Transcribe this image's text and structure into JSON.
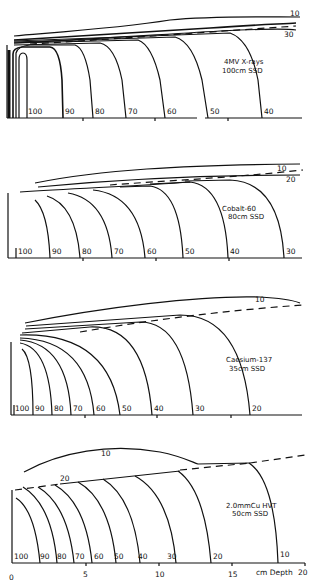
{
  "figure": {
    "type": "isodose charts",
    "x_axis": {
      "label": "cm Depth",
      "ticks": [
        "0",
        "5",
        "10",
        "15",
        "20"
      ]
    },
    "panels": [
      {
        "title_line1": "4MV X-rays",
        "title_line2": "100cm SSD",
        "isodose_labels_bottom": [
          "100",
          "90",
          "80",
          "70",
          "60",
          "50",
          "40"
        ],
        "isodose_labels_top": [
          "10",
          "30"
        ]
      },
      {
        "title_line1": "Cobalt-60",
        "title_line2": "80cm SSD",
        "isodose_labels_bottom": [
          "100",
          "90",
          "80",
          "70",
          "60",
          "50",
          "40",
          "30"
        ],
        "isodose_labels_top": [
          "10",
          "20"
        ]
      },
      {
        "title_line1": "Caesium-137",
        "title_line2": "35cm SSD",
        "isodose_labels_bottom": [
          "100",
          "90",
          "80",
          "70",
          "60",
          "50",
          "40",
          "30",
          "20"
        ],
        "isodose_labels_top": [
          "10"
        ]
      },
      {
        "title_line1": "2.0mmCu HVT",
        "title_line2": "50cm SSD",
        "isodose_labels_bottom": [
          "100",
          "90",
          "80",
          "70",
          "60",
          "50",
          "40",
          "30",
          "20",
          "10"
        ],
        "isodose_labels_top": [
          "10",
          "20"
        ]
      }
    ]
  }
}
